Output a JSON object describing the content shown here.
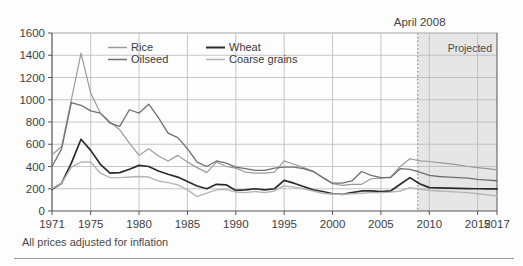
{
  "figure": {
    "caption": "All prices adjusted for inflation",
    "annotation_label": "April 2008",
    "projected_label": "Projected"
  },
  "colors": {
    "rice": "#9a9a9a",
    "oilseed": "#6f6f6f",
    "wheat": "#2b2b2b",
    "coarse_grains": "#b4b4b4",
    "grid": "#b8b8b8",
    "axis": "#555555",
    "shade": "#e6e6e6",
    "marker_line": "#9a9a9a",
    "text": "#3f3f3f",
    "background": "#fdfdfd",
    "rule": "#9a9a9a"
  },
  "chart_data": {
    "type": "line",
    "title": "",
    "subtitle": "",
    "xlabel": "",
    "ylabel": "",
    "xlim": [
      1971,
      2017
    ],
    "ylim": [
      0,
      1600
    ],
    "grid": true,
    "legend_position": "top-left-inside",
    "y_ticks": [
      0,
      200,
      400,
      600,
      800,
      1000,
      1200,
      1400,
      1600
    ],
    "x_ticks": [
      1971,
      1975,
      1980,
      1985,
      1990,
      1995,
      2000,
      2005,
      2010,
      2015,
      2017
    ],
    "x": [
      1971,
      1972,
      1973,
      1974,
      1975,
      1976,
      1977,
      1978,
      1979,
      1980,
      1981,
      1982,
      1983,
      1984,
      1985,
      1986,
      1987,
      1988,
      1989,
      1990,
      1991,
      1992,
      1993,
      1994,
      1995,
      1996,
      1997,
      1998,
      1999,
      2000,
      2001,
      2002,
      2003,
      2004,
      2005,
      2006,
      2007,
      2008,
      2009,
      2010,
      2011,
      2012,
      2013,
      2014,
      2015,
      2016,
      2017
    ],
    "annotations": [
      {
        "label": "April 2008",
        "x": 2008.8,
        "type": "vertical-dotted-line"
      },
      {
        "label": "Projected",
        "x_start": 2008.8,
        "x_end": 2017,
        "type": "shaded-region"
      }
    ],
    "series": [
      {
        "name": "Rice",
        "color": "#9a9a9a",
        "values": [
          505,
          580,
          1000,
          1420,
          1060,
          880,
          800,
          730,
          610,
          500,
          560,
          495,
          450,
          500,
          440,
          390,
          345,
          440,
          400,
          385,
          350,
          340,
          340,
          350,
          450,
          420,
          390,
          360,
          300,
          245,
          230,
          240,
          240,
          290,
          295,
          305,
          400,
          470,
          450,
          445,
          435,
          425,
          415,
          400,
          390,
          380,
          370
        ]
      },
      {
        "name": "Oilseed",
        "color": "#6f6f6f",
        "values": [
          400,
          560,
          975,
          950,
          900,
          880,
          790,
          760,
          910,
          880,
          960,
          840,
          700,
          660,
          560,
          440,
          400,
          450,
          430,
          395,
          380,
          365,
          365,
          385,
          395,
          395,
          380,
          355,
          300,
          250,
          250,
          270,
          355,
          320,
          300,
          300,
          380,
          375,
          350,
          320,
          310,
          305,
          300,
          295,
          285,
          278,
          272
        ]
      },
      {
        "name": "Wheat",
        "color": "#2b2b2b",
        "values": [
          195,
          250,
          430,
          645,
          545,
          420,
          340,
          345,
          375,
          410,
          400,
          360,
          330,
          305,
          265,
          225,
          200,
          240,
          235,
          185,
          190,
          200,
          190,
          200,
          275,
          250,
          220,
          190,
          175,
          155,
          150,
          165,
          180,
          180,
          175,
          180,
          240,
          300,
          245,
          210,
          208,
          206,
          204,
          202,
          200,
          199,
          198
        ]
      },
      {
        "name": "Coarse grains",
        "color": "#b4b4b4",
        "values": [
          200,
          250,
          395,
          440,
          440,
          340,
          300,
          300,
          305,
          310,
          305,
          270,
          255,
          235,
          190,
          130,
          160,
          190,
          195,
          170,
          165,
          175,
          165,
          180,
          225,
          215,
          200,
          180,
          160,
          150,
          150,
          155,
          160,
          165,
          165,
          170,
          180,
          210,
          195,
          185,
          180,
          175,
          170,
          165,
          155,
          145,
          135
        ]
      }
    ]
  },
  "legend": {
    "entries": [
      {
        "label": "Rice",
        "color": "#9a9a9a"
      },
      {
        "label": "Wheat",
        "color": "#2b2b2b"
      },
      {
        "label": "Oilseed",
        "color": "#6f6f6f"
      },
      {
        "label": "Coarse grains",
        "color": "#b4b4b4"
      }
    ]
  }
}
